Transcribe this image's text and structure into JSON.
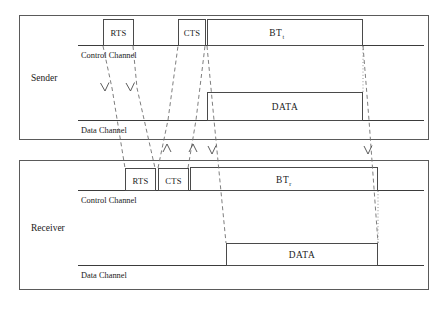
{
  "diagram": {
    "type": "timing-sequence",
    "nodes": [
      {
        "id": "sender",
        "label": "Sender",
        "channels": [
          {
            "id": "sender-control",
            "label": "Control Channel"
          },
          {
            "id": "sender-data",
            "label": "Data Channel"
          }
        ],
        "packets": [
          {
            "id": "sender-rts",
            "label": "RTS",
            "channel": "control"
          },
          {
            "id": "sender-cts",
            "label": "CTS",
            "channel": "control"
          },
          {
            "id": "sender-bt",
            "label": "BT",
            "sub": "t",
            "channel": "control"
          },
          {
            "id": "sender-data-pkt",
            "label": "DATA",
            "channel": "data"
          }
        ]
      },
      {
        "id": "receiver",
        "label": "Receiver",
        "channels": [
          {
            "id": "receiver-control",
            "label": "Control Channel"
          },
          {
            "id": "receiver-data",
            "label": "Data Channel"
          }
        ],
        "packets": [
          {
            "id": "receiver-rts",
            "label": "RTS",
            "channel": "control"
          },
          {
            "id": "receiver-cts",
            "label": "CTS",
            "channel": "control"
          },
          {
            "id": "receiver-bt",
            "label": "BT",
            "sub": "r",
            "channel": "control"
          },
          {
            "id": "receiver-data-pkt",
            "label": "DATA",
            "channel": "data"
          }
        ]
      }
    ],
    "colors": {
      "panel_border": "#5a5a5a",
      "channel_line": "#3b3b3b",
      "packet_border": "#4a4a4a",
      "propagation": "#6f6f6f",
      "dotted": "#8a8a8a",
      "text": "#1a1a1a",
      "background": "#ffffff"
    }
  }
}
